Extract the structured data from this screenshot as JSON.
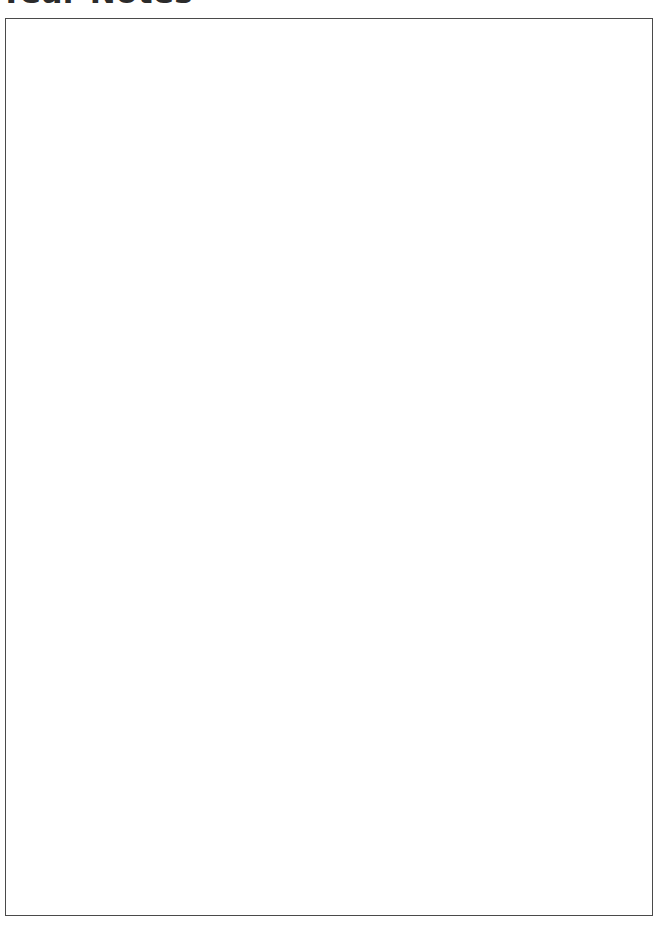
{
  "page": {
    "background_color": "#ffffff",
    "width": 668,
    "height": 927
  },
  "heading": {
    "text": "Year Notes",
    "visible_fragment": "ear Notes",
    "color": "#2b2b2b",
    "clipped_at_top": "true"
  },
  "notes_box": {
    "label": "",
    "content": "",
    "placeholder": "",
    "border_color": "#4a4a4a",
    "fill_color": "#ffffff",
    "is_empty": "true"
  }
}
